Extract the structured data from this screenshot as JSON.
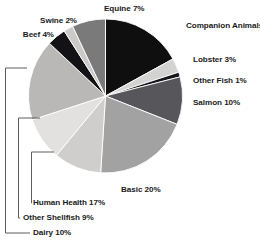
{
  "chart_data": {
    "type": "pie",
    "title": "",
    "subtitle": "",
    "xlabel": "",
    "ylabel": "",
    "grid": false,
    "legend_position": "none",
    "start_angle_deg": 0,
    "direction": "clockwise",
    "units": "percent",
    "total": 100,
    "categories": [
      "Companion Animals",
      "Lobster",
      "Other Fish",
      "Salmon",
      "Basic",
      "Dairy",
      "Other Shellfish",
      "Human Health",
      "Beef",
      "Swine",
      "Equine"
    ],
    "values": [
      17,
      3,
      1,
      10,
      20,
      10,
      9,
      17,
      4,
      2,
      7
    ],
    "labels": [
      "Companion Animals 17%",
      "Lobster 3%",
      "Other Fish 1%",
      "Salmon 10%",
      "Basic 20%",
      "Dairy 10%",
      "Other Shellfish 9%",
      "Human Health 17%",
      "Beef 4%",
      "Swine 2%",
      "Equine 7%"
    ],
    "colors": [
      "#100f0f",
      "#d3d3d2",
      "#17161a",
      "#57565a",
      "#a3a2a2",
      "#cfcecc",
      "#e2e1df",
      "#b9b8b6",
      "#131214",
      "#cbcac8",
      "#7b7a7b"
    ],
    "slices": [
      {
        "name": "Companion Animals",
        "value": 17,
        "label": "Companion Animals 17%",
        "color": "#100f0f"
      },
      {
        "name": "Lobster",
        "value": 3,
        "label": "Lobster 3%",
        "color": "#d3d3d2"
      },
      {
        "name": "Other Fish",
        "value": 1,
        "label": "Other Fish 1%",
        "color": "#17161a"
      },
      {
        "name": "Salmon",
        "value": 10,
        "label": "Salmon 10%",
        "color": "#57565a"
      },
      {
        "name": "Basic",
        "value": 20,
        "label": "Basic 20%",
        "color": "#a3a2a2"
      },
      {
        "name": "Dairy",
        "value": 10,
        "label": "Dairy 10%",
        "color": "#cfcecc"
      },
      {
        "name": "Other Shellfish",
        "value": 9,
        "label": "Other Shellfish 9%",
        "color": "#e2e1df"
      },
      {
        "name": "Human Health",
        "value": 17,
        "label": "Human Health 17%",
        "color": "#b9b8b6"
      },
      {
        "name": "Beef",
        "value": 4,
        "label": "Beef 4%",
        "color": "#131214"
      },
      {
        "name": "Swine",
        "value": 2,
        "label": "Swine 2%",
        "color": "#cbcac8"
      },
      {
        "name": "Equine",
        "value": 7,
        "label": "Equine 7%",
        "color": "#7b7a7b"
      }
    ],
    "leader_brackets": [
      {
        "target": "Human Health",
        "label": "Human Health 17%"
      },
      {
        "target": "Other Shellfish",
        "label": "Other Shellfish 9%"
      },
      {
        "target": "Dairy",
        "label": "Dairy 10%"
      }
    ]
  },
  "style": {
    "background": "#ffffff",
    "text_color": "#1a1a1a",
    "leader_color": "#4a4a4a",
    "slice_stroke": "#ffffff"
  }
}
